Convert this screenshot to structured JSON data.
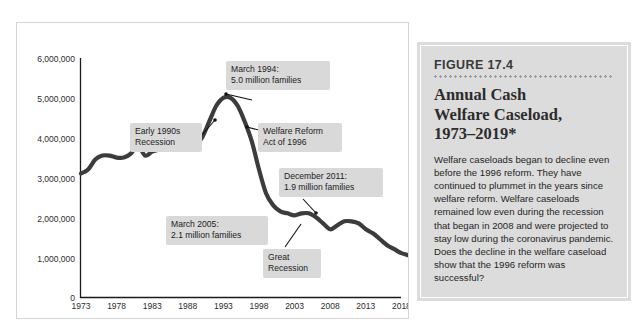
{
  "figure": {
    "kicker": "FIGURE 17.4",
    "title": "Annual Cash\nWelfare Caseload,\n1973–2019*",
    "body": "Welfare caseloads began to decline even before the 1996 reform. They have continued to plummet in the years since welfare reform. Welfare caseloads remained low even during the recession that began in 2008 and were projected to stay low during the coronavirus pandemic. Does the decline in the welfare caseload show that the 1996 reform was successful?"
  },
  "colors": {
    "line": "#3c3c3c",
    "callout_background": "#d9d9d9",
    "figure_background": "#dcdcdc",
    "panel_border": "#d5d5d5",
    "axis": "#1b1b1b"
  },
  "annotations": [
    {
      "name": "early-1990s-recession",
      "text": "Early 1990s\nRecession"
    },
    {
      "name": "march-1994-peak",
      "text": "March 1994:\n5.0 million families"
    },
    {
      "name": "welfare-reform-act-1996",
      "text": "Welfare Reform\nAct of 1996"
    },
    {
      "name": "december-2011",
      "text": "December 2011:\n1.9 million families"
    },
    {
      "name": "march-2005",
      "text": "March 2005:\n2.1 million families"
    },
    {
      "name": "great-recession",
      "text": "Great\nRecession"
    }
  ],
  "chart_data": {
    "type": "line",
    "title": "Annual Cash Welfare Caseload, 1973–2019",
    "xlabel": "",
    "ylabel": "",
    "xlim": [
      1973,
      2019
    ],
    "ylim": [
      0,
      6000000
    ],
    "grid": false,
    "legend": null,
    "ytick_labels": [
      "6,000,000",
      "5,000,000",
      "4,000,000",
      "3,000,000",
      "2,000,000",
      "1,000,000",
      "0"
    ],
    "ytick_values": [
      6000000,
      5000000,
      4000000,
      3000000,
      2000000,
      1000000,
      0
    ],
    "xtick_labels": [
      "1973",
      "1978",
      "1983",
      "1988",
      "1993",
      "1998",
      "2003",
      "2008",
      "2013",
      "2018"
    ],
    "xtick_values": [
      1973,
      1978,
      1983,
      1988,
      1993,
      1998,
      2003,
      2008,
      2013,
      2018
    ],
    "series": [
      {
        "name": "Families receiving cash welfare",
        "units": "families",
        "x": [
          1973,
          1974,
          1975,
          1976,
          1977,
          1978,
          1979,
          1980,
          1981,
          1982,
          1983,
          1984,
          1985,
          1986,
          1987,
          1988,
          1989,
          1990,
          1991,
          1992,
          1993,
          1994,
          1995,
          1996,
          1997,
          1998,
          1999,
          2000,
          2001,
          2002,
          2003,
          2004,
          2005,
          2006,
          2007,
          2008,
          2009,
          2010,
          2011,
          2012,
          2013,
          2014,
          2015,
          2016,
          2017,
          2018,
          2019
        ],
        "y": [
          3100000,
          3200000,
          3450000,
          3550000,
          3550000,
          3500000,
          3500000,
          3600000,
          3800000,
          3550000,
          3650000,
          3700000,
          3700000,
          3700000,
          3700000,
          3750000,
          3800000,
          4000000,
          4400000,
          4800000,
          5000000,
          5000000,
          4800000,
          4400000,
          3900000,
          3200000,
          2600000,
          2300000,
          2150000,
          2100000,
          2050000,
          2100000,
          2100000,
          2000000,
          1850000,
          1700000,
          1800000,
          1900000,
          1900000,
          1850000,
          1700000,
          1600000,
          1450000,
          1300000,
          1200000,
          1100000,
          1050000
        ]
      }
    ],
    "annotated_points": [
      {
        "label": "March 1994: 5.0 million families",
        "x": 1994,
        "y": 5000000
      },
      {
        "label": "Welfare Reform Act of 1996",
        "x": 1996,
        "y": 4400000
      },
      {
        "label": "March 2005: 2.1 million families",
        "x": 2005,
        "y": 2100000
      },
      {
        "label": "December 2011: 1.9 million families",
        "x": 2011,
        "y": 1900000
      },
      {
        "label": "Great Recession",
        "x": 2008,
        "y": 1700000
      },
      {
        "label": "Early 1990s Recession",
        "x": 1991,
        "y": 4400000
      }
    ]
  }
}
